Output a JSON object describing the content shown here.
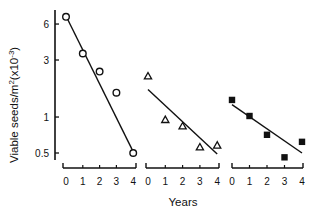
{
  "chart_data": {
    "type": "scatter",
    "title": "",
    "ylabel": "Viable seeds/m2(x10-3)",
    "ylabel_parts": {
      "main": "Viable seeds/m",
      "sup1": "2",
      "mid": "(x10",
      "sup2": "-3",
      "end": ")"
    },
    "xlabel": "Years",
    "yscale": "log",
    "ylim": [
      0.45,
      7.5
    ],
    "y_ticks": [
      6,
      3,
      1,
      0.5
    ],
    "y_tick_labels": [
      "6",
      "3",
      "1",
      "0.5"
    ],
    "grid": false,
    "legend": null,
    "panels": [
      {
        "name": "panel-1",
        "marker": "circle-open",
        "x": [
          0,
          1,
          2,
          3,
          4
        ],
        "x_tick_labels": [
          "0",
          "1",
          "2",
          "3",
          "4"
        ],
        "values": [
          6.9,
          3.4,
          2.4,
          1.6,
          0.5
        ],
        "fit_line": {
          "x0": 0,
          "y0": 7.0,
          "x1": 4.1,
          "y1": 0.48
        }
      },
      {
        "name": "panel-2",
        "marker": "triangle-open",
        "x": [
          0,
          1,
          2,
          3,
          4
        ],
        "x_tick_labels": [
          "0",
          "1",
          "2",
          "3",
          "4"
        ],
        "values": [
          2.2,
          0.95,
          0.84,
          0.56,
          0.58
        ],
        "fit_line": {
          "x0": 0,
          "y0": 1.7,
          "x1": 4,
          "y1": 0.49
        }
      },
      {
        "name": "panel-3",
        "marker": "square-filled",
        "x": [
          0,
          1,
          2,
          3,
          4
        ],
        "x_tick_labels": [
          "0",
          "1",
          "2",
          "3",
          "4"
        ],
        "values": [
          1.39,
          1.02,
          0.71,
          0.46,
          0.62
        ],
        "fit_line": {
          "x0": 0,
          "y0": 1.27,
          "x1": 4,
          "y1": 0.5
        }
      }
    ]
  },
  "layout_px": {
    "y_axis_x": 55,
    "y_top": 10,
    "y_bottom": 160,
    "log_ref_value": 0.5,
    "log_ref_y": 153,
    "px_per_decade": 119.5,
    "x_axis_y": 163,
    "panels_x": [
      {
        "x0": 66,
        "dx": 16.8,
        "axis_from": 63,
        "axis_to": 136
      },
      {
        "x0": 148,
        "dx": 17.3,
        "axis_from": 146,
        "axis_to": 219
      },
      {
        "x0": 232,
        "dx": 17.5,
        "axis_from": 232,
        "axis_to": 303
      }
    ]
  },
  "colors": {
    "ink": "#111111",
    "background": "#ffffff"
  }
}
